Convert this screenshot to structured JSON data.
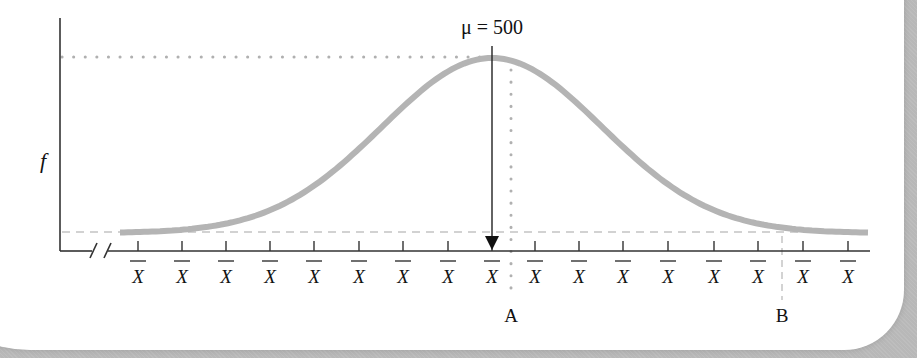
{
  "diagram": {
    "type": "normal-curve",
    "y_axis_label": "f",
    "mean_label": "μ = 500",
    "marker_a_label": "A",
    "marker_b_label": "B",
    "tick_label": "X̄",
    "tick_count": 17,
    "axis_break": "//",
    "colors": {
      "curve": "#b4b4b4",
      "axis": "#333333",
      "guides": "#b0b0b0",
      "shadow": "#b8b8b8"
    }
  },
  "ticks": [
    "X",
    "X",
    "X",
    "X",
    "X",
    "X",
    "X",
    "X",
    "X",
    "X",
    "X",
    "X",
    "X",
    "X",
    "X",
    "X",
    "X"
  ]
}
